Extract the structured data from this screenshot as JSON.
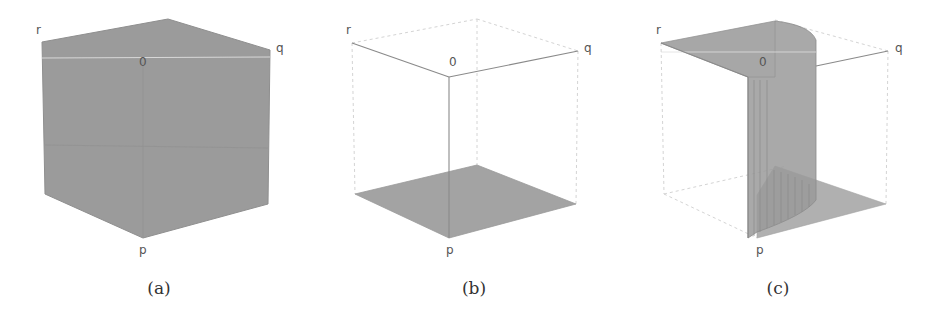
{
  "figure": {
    "panels": [
      {
        "id": "a",
        "caption": "(a)",
        "description": "Solid filled cube (entire region shaded)",
        "labels": {
          "r": "r",
          "q": "q",
          "origin": "0",
          "p": "p"
        }
      },
      {
        "id": "b",
        "caption": "(b)",
        "description": "Wireframe cube with only the bottom face shaded",
        "labels": {
          "r": "r",
          "q": "q",
          "origin": "0",
          "p": "p"
        }
      },
      {
        "id": "c",
        "caption": "(c)",
        "description": "Wireframe cube with top face (r side), a curved vertical wall, and bottom face (q side) shaded",
        "labels": {
          "r": "r",
          "q": "q",
          "origin": "0",
          "p": "p"
        }
      }
    ],
    "colors": {
      "fill": "#9b9b9b",
      "fill_light": "#b4b4b4",
      "edge_solid": "#8a8a8a",
      "edge_dashed": "#d4d4d4",
      "label": "#555555"
    }
  }
}
